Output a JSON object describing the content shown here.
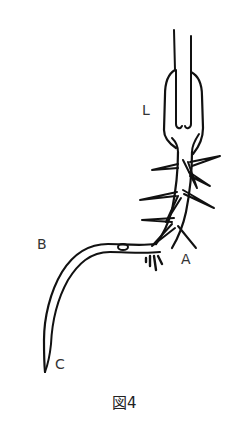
{
  "figure": {
    "caption": "図4",
    "labels": {
      "L": "L",
      "A": "A",
      "B": "B",
      "C": "C"
    }
  },
  "colors": {
    "line": "#111111",
    "background": "#ffffff",
    "label": "#333333"
  }
}
